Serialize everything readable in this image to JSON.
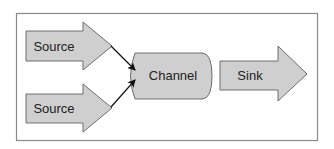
{
  "diagram": {
    "type": "flow",
    "colors": {
      "fill": "#cfcfcf",
      "stroke": "#6e6e6e",
      "frame": "#8a8a8a",
      "arrow": "#111111"
    },
    "nodes": [
      {
        "id": "source1",
        "shape": "block-arrow",
        "label": "Source"
      },
      {
        "id": "source2",
        "shape": "block-arrow",
        "label": "Source"
      },
      {
        "id": "channel",
        "shape": "concave-rect",
        "label": "Channel"
      },
      {
        "id": "sink",
        "shape": "block-arrow",
        "label": "Sink"
      }
    ],
    "edges": [
      {
        "from": "source1",
        "to": "channel"
      },
      {
        "from": "source2",
        "to": "channel"
      }
    ]
  }
}
